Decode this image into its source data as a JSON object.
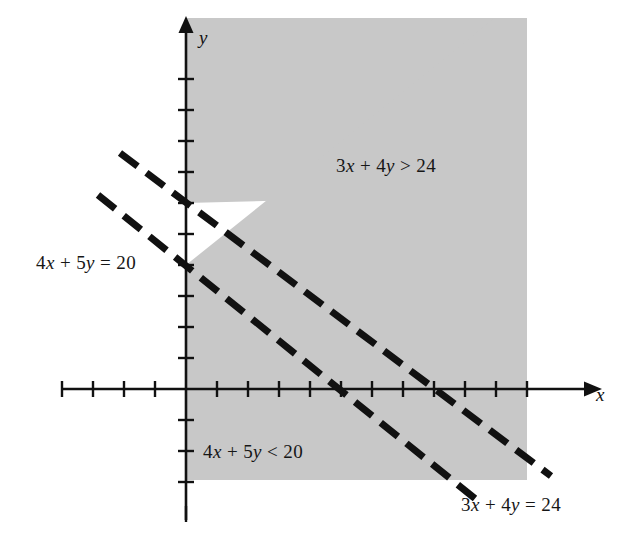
{
  "figure": {
    "type": "math-inequality-graph",
    "background_color": "#ffffff",
    "shade_color": "#c8c8c8",
    "line_color": "#111111",
    "axis_color": "#111111"
  },
  "axes": {
    "x_label": "x",
    "y_label": "y",
    "x_label_name": "x-axis-label",
    "y_label_name": "y-axis-label",
    "origin_px": [
      186,
      389
    ],
    "unit_px": 31,
    "x_ticks": [
      -4,
      -3,
      -2,
      -1,
      1,
      2,
      3,
      4,
      5,
      6,
      7,
      8,
      9,
      10,
      11
    ],
    "y_ticks": [
      -3,
      -2,
      -1,
      1,
      2,
      3,
      4,
      5,
      6,
      7,
      8,
      9,
      10,
      11
    ],
    "x_range": [
      -4.2,
      12.6
    ],
    "y_range": [
      -3.7,
      12.0
    ]
  },
  "labels": {
    "region_upper": "3x + 4y > 24",
    "line_lower": "4x + 5y = 20",
    "region_lower": "4x + 5y < 20",
    "line_upper": "3x + 4y = 24"
  },
  "chart_data": {
    "type": "line",
    "title": "",
    "xlabel": "x",
    "ylabel": "y",
    "xlim": [
      -4.2,
      12.6
    ],
    "ylim": [
      -3.7,
      12.0
    ],
    "grid": false,
    "legend": "none",
    "series": [
      {
        "name": "3x + 4y = 24",
        "equation": "3x + 4y = 24",
        "style": "dashed",
        "slope": -0.75,
        "y_intercept": 6,
        "x_intercept": 8,
        "label": "3x + 4y = 24",
        "label_position": "bottom-right"
      },
      {
        "name": "4x + 5y = 20",
        "equation": "4x + 5y = 20",
        "style": "dashed",
        "slope": -0.8,
        "y_intercept": 4,
        "x_intercept": 5,
        "label": "4x + 5y = 20",
        "label_position": "left"
      }
    ],
    "shaded_regions": [
      {
        "name": "3x + 4y > 24",
        "inequality": "3x + 4y > 24",
        "fill": "#c8c8c8",
        "label": "3x + 4y > 24",
        "label_point": [
          5.5,
          7.5
        ]
      },
      {
        "name": "4x + 5y < 20",
        "inequality": "4x + 5y < 20",
        "fill": "#c8c8c8",
        "label": "4x + 5y < 20",
        "label_point": [
          1.4,
          -2.1
        ]
      }
    ],
    "unshaded_band": {
      "description": "white strip between the two dashed lines",
      "fill": "#ffffff"
    },
    "annotations": [
      {
        "text": "3x + 4y > 24",
        "x": 5.5,
        "y": 7.5
      },
      {
        "text": "4x + 5y = 20",
        "x": -4.6,
        "y": 4.2
      },
      {
        "text": "4x + 5y < 20",
        "x": 1.4,
        "y": -2.1
      },
      {
        "text": "3x + 4y = 24",
        "x": 9.5,
        "y": -3.6
      }
    ]
  }
}
